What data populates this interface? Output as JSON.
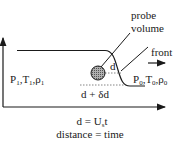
{
  "diagram": {
    "labels": {
      "probe_line1": "probe",
      "probe_line2": "volume",
      "front": "front",
      "left_state": {
        "P": "P",
        "P_sub": "1",
        "T": "T",
        "T_sub": "1",
        "rho": "ρ",
        "rho_sub": "1"
      },
      "right_state": {
        "P": "P",
        "P_sub": "0",
        "T": "T",
        "T_sub": "0",
        "rho": "ρ",
        "rho_sub": "0"
      },
      "d": "d",
      "d_plus_delta": "d + δd",
      "equation": {
        "lhs": "d = U",
        "sub": "s",
        "rhs": "t"
      },
      "caption": "distance = time"
    },
    "colors": {
      "ink": "#1a1a1a",
      "probe_fill": "#8a8a8a",
      "dotted": "#666666"
    }
  }
}
